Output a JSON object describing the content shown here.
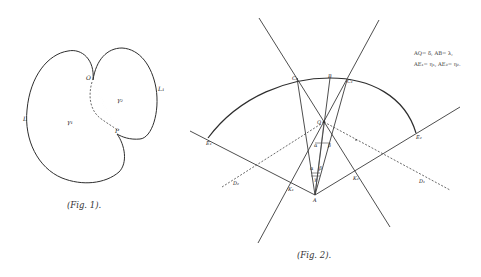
{
  "figure1": {
    "caption": "(Fig. 1).",
    "labels": {
      "O": "O",
      "P": "P",
      "L1": "L",
      "L2": "L₁",
      "region1": "γ₁",
      "region2": "γ₂"
    }
  },
  "figure2": {
    "caption": "(Fig. 2).",
    "annotation": {
      "line1": "AQ= δ,  AB= λ,",
      "line2": "AE₁= η₁,  AE₂= η₂."
    },
    "labels": {
      "C2": "C₂",
      "B": "B",
      "C1": "C₁",
      "Q": "Q",
      "E1": "E₁",
      "E2": "E₂",
      "D1": "D₁",
      "D2": "D₂",
      "A": "A",
      "K1": "K₁",
      "K2": "K₂",
      "alpha": "α",
      "beta": "β",
      "alpha1": "α",
      "beta1": "β",
      "gamma": "γ"
    }
  }
}
